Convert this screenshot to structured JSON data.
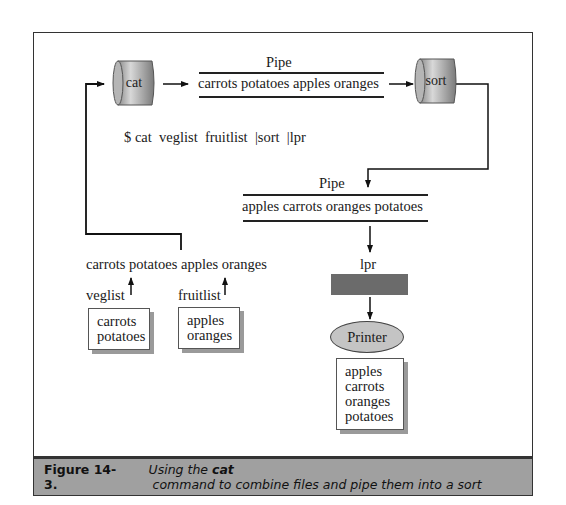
{
  "diagram": {
    "processes": {
      "cat": "cat",
      "sort": "sort"
    },
    "pipe1": {
      "label": "Pipe",
      "content": "carrots potatoes apples oranges"
    },
    "command": {
      "prompt": "$",
      "text": "cat  veglist  fruitlist  |sort  |lpr"
    },
    "pipe2": {
      "label": "Pipe",
      "content": "apples carrots oranges potatoes"
    },
    "combined_output": "carrots potatoes apples oranges",
    "files": [
      {
        "name": "veglist",
        "lines": [
          "carrots",
          "potatoes"
        ]
      },
      {
        "name": "fruitlist",
        "lines": [
          "apples",
          "oranges"
        ]
      }
    ],
    "lpr_label": "lpr",
    "printer_label": "Printer",
    "printout": [
      "apples",
      "carrots",
      "oranges",
      "potatoes"
    ]
  },
  "caption": {
    "number": "Figure 14-3.",
    "text_before": "Using the ",
    "command": "cat",
    "text_after": " command to combine files and pipe them into a sort"
  }
}
